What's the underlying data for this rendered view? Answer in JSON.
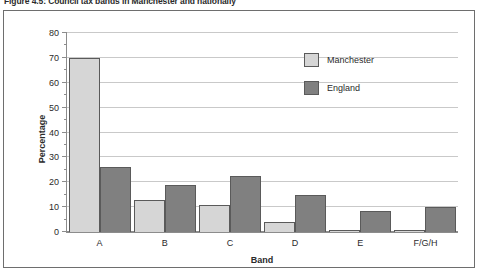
{
  "figure": {
    "caption": "Figure 4.5: Council tax bands in Manchester and nationally"
  },
  "chart_data": {
    "type": "bar",
    "title": "Council tax bands in Manchester and nationally",
    "categories": [
      "A",
      "B",
      "C",
      "D",
      "E",
      "F/G/H"
    ],
    "series": [
      {
        "name": "Manchester",
        "color": "#d6d6d6",
        "values": [
          70,
          13,
          11,
          4,
          1,
          1
        ]
      },
      {
        "name": "England",
        "color": "#808080",
        "values": [
          26,
          19,
          22.5,
          15,
          8.5,
          10
        ]
      }
    ],
    "xlabel": "Band",
    "ylabel": "Percentage",
    "ylim": [
      0,
      80
    ],
    "yticks": [
      0,
      10,
      20,
      30,
      40,
      50,
      60,
      70,
      80
    ],
    "ytick_labels": [
      "0",
      "10",
      "20",
      "30",
      "40",
      "50",
      "60",
      "70",
      "80"
    ],
    "grid": true,
    "legend_position": "upper right"
  }
}
